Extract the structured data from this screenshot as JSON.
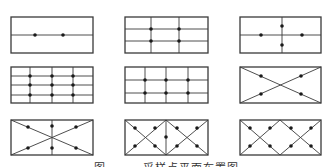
{
  "figure": {
    "caption": "图 — — 采样点平面布置图",
    "stroke_color": "#3a3a3a",
    "dot_color": "#1a1a1a",
    "panels": [
      {
        "id": "p1",
        "rect": [
          11,
          17,
          93,
          53
        ],
        "lines": [
          [
            11,
            35,
            93,
            35
          ]
        ],
        "dots": [
          [
            35,
            35
          ],
          [
            63,
            35
          ]
        ]
      },
      {
        "id": "p2",
        "rect": [
          125,
          17,
          208,
          53
        ],
        "lines": [
          [
            125,
            29,
            208,
            29
          ],
          [
            125,
            41,
            208,
            41
          ],
          [
            151,
            17,
            151,
            53
          ],
          [
            179,
            17,
            179,
            53
          ]
        ],
        "dots": [
          [
            151,
            29
          ],
          [
            179,
            29
          ],
          [
            151,
            41
          ],
          [
            179,
            41
          ]
        ]
      },
      {
        "id": "p3",
        "rect": [
          240,
          17,
          321,
          53
        ],
        "lines": [
          [
            240,
            35,
            321,
            35
          ],
          [
            282,
            17,
            282,
            53
          ]
        ],
        "dots": [
          [
            261,
            35
          ],
          [
            302,
            35
          ],
          [
            282,
            26
          ],
          [
            282,
            45
          ]
        ]
      },
      {
        "id": "p4",
        "rect": [
          11,
          67,
          93,
          103
        ],
        "lines": [
          [
            11,
            76,
            93,
            76
          ],
          [
            11,
            85,
            93,
            85
          ],
          [
            11,
            95,
            93,
            95
          ],
          [
            30,
            67,
            30,
            103
          ],
          [
            52,
            67,
            52,
            103
          ],
          [
            73,
            67,
            73,
            103
          ]
        ],
        "dots": [
          [
            30,
            76
          ],
          [
            52,
            76
          ],
          [
            73,
            76
          ],
          [
            30,
            85
          ],
          [
            52,
            85
          ],
          [
            73,
            85
          ],
          [
            30,
            95
          ],
          [
            52,
            95
          ],
          [
            73,
            95
          ]
        ]
      },
      {
        "id": "p5",
        "rect": [
          125,
          67,
          208,
          103
        ],
        "lines": [
          [
            125,
            80,
            208,
            80
          ],
          [
            125,
            93,
            208,
            93
          ],
          [
            145,
            67,
            145,
            103
          ],
          [
            166,
            67,
            166,
            103
          ],
          [
            188,
            67,
            188,
            103
          ]
        ],
        "dots": [
          [
            145,
            80
          ],
          [
            166,
            80
          ],
          [
            188,
            80
          ],
          [
            145,
            93
          ],
          [
            166,
            93
          ],
          [
            188,
            93
          ]
        ]
      },
      {
        "id": "p6",
        "rect": [
          240,
          67,
          321,
          103
        ],
        "lines": [
          [
            240,
            67,
            321,
            103
          ],
          [
            240,
            103,
            321,
            67
          ]
        ],
        "dots": [
          [
            261,
            76
          ],
          [
            301,
            76
          ],
          [
            261,
            94
          ],
          [
            301,
            94
          ]
        ]
      },
      {
        "id": "p7",
        "rect": [
          11,
          120,
          93,
          155
        ],
        "lines": [
          [
            11,
            120,
            93,
            155
          ],
          [
            11,
            155,
            93,
            120
          ],
          [
            52,
            120,
            52,
            155
          ]
        ],
        "dots": [
          [
            28,
            127
          ],
          [
            76,
            127
          ],
          [
            52,
            126
          ],
          [
            28,
            148
          ],
          [
            76,
            148
          ],
          [
            52,
            148
          ]
        ]
      },
      {
        "id": "p8",
        "rect": [
          125,
          120,
          208,
          155
        ],
        "lines": [
          [
            166,
            120,
            166,
            155
          ],
          [
            125,
            120,
            166,
            155
          ],
          [
            125,
            155,
            166,
            120
          ],
          [
            166,
            120,
            208,
            155
          ],
          [
            166,
            155,
            208,
            120
          ]
        ],
        "dots": [
          [
            135,
            128
          ],
          [
            155,
            128
          ],
          [
            135,
            146
          ],
          [
            155,
            146
          ],
          [
            166,
            137
          ],
          [
            177,
            128
          ],
          [
            197,
            128
          ],
          [
            177,
            146
          ],
          [
            197,
            146
          ]
        ]
      },
      {
        "id": "p9",
        "rect": [
          240,
          120,
          321,
          155
        ],
        "lines": [
          [
            240,
            120,
            280,
            155
          ],
          [
            240,
            155,
            280,
            120
          ],
          [
            280,
            120,
            321,
            155
          ],
          [
            280,
            155,
            321,
            120
          ]
        ],
        "dots": [
          [
            250,
            128
          ],
          [
            270,
            128
          ],
          [
            250,
            146
          ],
          [
            270,
            146
          ],
          [
            291,
            128
          ],
          [
            311,
            128
          ],
          [
            291,
            146
          ],
          [
            311,
            146
          ]
        ]
      }
    ]
  }
}
